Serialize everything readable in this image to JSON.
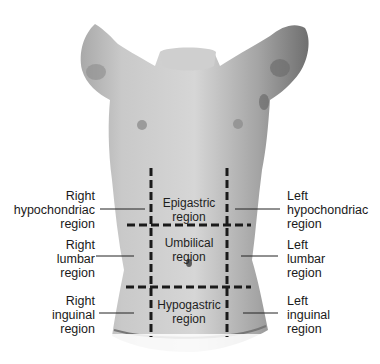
{
  "figure": {
    "colors": {
      "skin_light": "#d8d8d8",
      "skin_mid": "#b5b5b5",
      "skin_dark": "#8a8a8a",
      "line": "#1a1a1a",
      "text": "#1a1a1a"
    }
  },
  "side_labels": {
    "right_hypochondriac": [
      "Right",
      "hypochondriac",
      "region"
    ],
    "right_lumbar": [
      "Right",
      "lumbar",
      "region"
    ],
    "right_inguinal": [
      "Right",
      "inguinal",
      "region"
    ],
    "left_hypochondriac": [
      "Left",
      "hypochondriac",
      "region"
    ],
    "left_lumbar": [
      "Left",
      "lumbar",
      "region"
    ],
    "left_inguinal": [
      "Left",
      "inguinal",
      "region"
    ]
  },
  "center_labels": {
    "epigastric": [
      "Epigastric",
      "region"
    ],
    "umbilical": [
      "Umbilical",
      "region"
    ],
    "hypogastric": [
      "Hypogastric",
      "region"
    ]
  }
}
